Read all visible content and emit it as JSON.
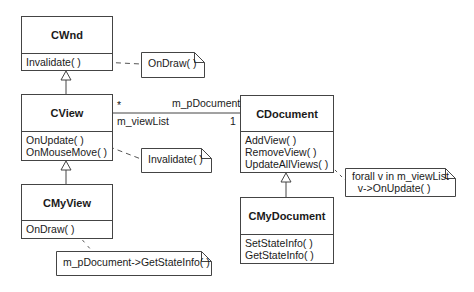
{
  "classes": {
    "cwnd": {
      "name": "CWnd",
      "operations": [
        "Invalidate( )"
      ]
    },
    "cview": {
      "name": "CView",
      "operations": [
        "OnUpdate( )",
        "OnMouseMove( )"
      ]
    },
    "cmyview": {
      "name": "CMyView",
      "operations": [
        "OnDraw( )"
      ]
    },
    "cdocument": {
      "name": "CDocument",
      "operations": [
        "AddView( )",
        "RemoveView( )",
        "UpdateAllViews( )"
      ]
    },
    "cmydocument": {
      "name": "CMyDocument",
      "operations": [
        "SetStateInfo( )",
        "GetStateInfo( )"
      ]
    }
  },
  "notes": {
    "ondraw": "OnDraw( )",
    "invalidate": "Invalidate( )",
    "getstateinfo": "m_pDocument->GetStateInfo( )",
    "forall_line1": "forall v in m_viewList",
    "forall_line2": "  v->OnUpdate( )"
  },
  "association": {
    "view_multiplicity": "*",
    "view_role": "m_viewList",
    "document_role": "m_pDocument",
    "document_multiplicity": "1"
  }
}
